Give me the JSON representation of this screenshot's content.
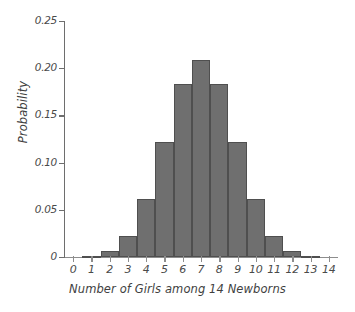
{
  "chart_data": {
    "type": "bar",
    "title": "",
    "subtitle": "",
    "xlabel": "Number of Girls among 14 Newborns",
    "ylabel": "Probability",
    "categories": [
      "0",
      "1",
      "2",
      "3",
      "4",
      "5",
      "6",
      "7",
      "8",
      "9",
      "10",
      "11",
      "12",
      "13",
      "14"
    ],
    "values": [
      0.0,
      0.001,
      0.006,
      0.022,
      0.061,
      0.122,
      0.183,
      0.209,
      0.183,
      0.122,
      0.061,
      0.022,
      0.006,
      0.001,
      0.0
    ],
    "xlim": [
      -0.5,
      14.5
    ],
    "ylim": [
      0,
      0.25
    ],
    "ytick_labels": [
      "0",
      "0.05",
      "0.10",
      "0.15",
      "0.20",
      "0.25"
    ],
    "ytick_values": [
      0,
      0.05,
      0.1,
      0.15,
      0.2,
      0.25
    ],
    "xtick_labels": [
      "0",
      "1",
      "2",
      "3",
      "4",
      "5",
      "6",
      "7",
      "8",
      "9",
      "10",
      "11",
      "12",
      "13",
      "14"
    ],
    "grid": false,
    "legend": null,
    "bar_color": "#6f6f6f",
    "bar_edge_color": "#4f4f4f",
    "axis_color": "#6e6e6e",
    "background_color": "#ffffff"
  }
}
